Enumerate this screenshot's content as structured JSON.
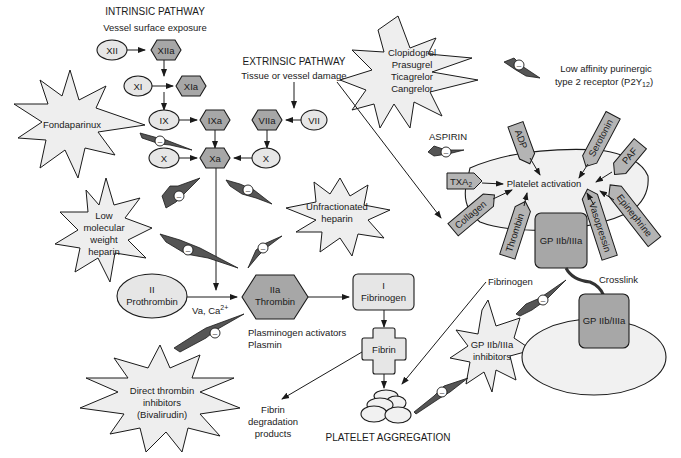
{
  "headings": {
    "intrinsic": "INTRINSIC PATHWAY",
    "intrinsic_sub": "Vessel surface exposure",
    "extrinsic": "EXTRINSIC PATHWAY",
    "extrinsic_sub": "Tissue or vessel damage",
    "aspirin": "ASPIRIN",
    "platelet_aggregation": "PLATELET AGGREGATION"
  },
  "factors": {
    "xii": "XII",
    "xiia": "XIIa",
    "xi": "XI",
    "xia": "XIa",
    "ix": "IX",
    "ixa": "IXa",
    "viia": "VIIa",
    "vii": "VII",
    "x_left": "X",
    "xa": "Xa",
    "x_right": "X",
    "prothrombin_num": "II",
    "prothrombin": "Prothrombin",
    "thrombin_num": "IIa",
    "thrombin": "Thrombin",
    "fibrinogen_num": "I",
    "fibrinogen": "Fibrinogen",
    "fibrin": "Fibrin"
  },
  "labels": {
    "cofactors": "Va, Ca",
    "cofactors_sup": "2+",
    "plasminogen": "Plasminogen activators",
    "plasmin": "Plasmin",
    "fdp_1": "Fibrin",
    "fdp_2": "degradation",
    "fdp_3": "products",
    "fibrinogen_bridge": "Fibrinogen",
    "crosslink": "Crosslink",
    "p2y12_1": "Low affinity purinergic",
    "p2y12_2": "type 2 receptor (P2Y",
    "p2y12_sub": "12",
    "p2y12_close": ")"
  },
  "drugs": {
    "fondaparinux": "Fondaparinux",
    "lmwh": [
      "Low",
      "molecular",
      "weight",
      "heparin"
    ],
    "ufh": [
      "Unfractionated",
      "heparin"
    ],
    "p2y12_inhibitors": [
      "Clopidogrel",
      "Prasugrel",
      "Ticagrelor",
      "Cangrelor"
    ],
    "dti": [
      "Direct thrombin",
      "inhibitors",
      "(Bivalirudin)"
    ],
    "gp_inhibitors": [
      "GP IIb/IIIa",
      "inhibitors"
    ]
  },
  "platelet": {
    "activation": "Platelet activation",
    "receptor_gp": "GP IIb/IIIa",
    "receptor_gp2": "GP IIb/IIIa",
    "agonists": {
      "adp": "ADP",
      "serotonin": "Serotonin",
      "paf": "PAF",
      "txa2": "TXA",
      "txa2_sub": "2",
      "collagen": "Collagen",
      "thrombin": "Thrombin",
      "vasopressin": "Vasopressin",
      "epinephrine": "Epinephrine"
    }
  },
  "inhibition_symbol": "–",
  "colors": {
    "activated_factor": "#a7a7a7",
    "zymogen": "#e6e6e6",
    "drug_star": "#eeeeee",
    "bolt": "#555555",
    "stroke": "#1a1a1a"
  }
}
